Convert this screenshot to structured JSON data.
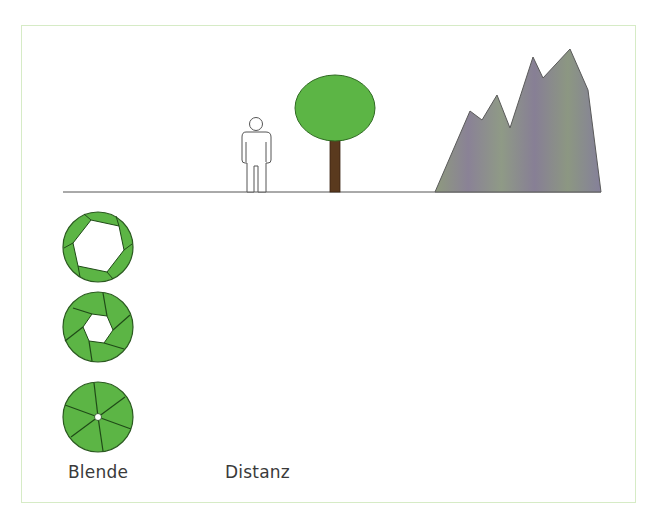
{
  "diagram": {
    "labels": {
      "aperture": "Blende",
      "distance": "Distanz"
    },
    "colors": {
      "frame_border": "#d6ebc6",
      "ground_line": "#555555",
      "tree_crown": "#5cb545",
      "tree_trunk": "#5a3a1e",
      "aperture_fill": "#5cb545",
      "aperture_stroke": "#1f4a17",
      "mountain_fill": "#8a8a90",
      "person_stroke": "#555555"
    },
    "scene": {
      "objects": [
        "person",
        "tree",
        "mountain"
      ],
      "description": "Person near, tree middle, mountains far along a ground line"
    },
    "apertures": [
      {
        "name": "wide-open",
        "opening": "large"
      },
      {
        "name": "medium",
        "opening": "medium"
      },
      {
        "name": "closed-down",
        "opening": "small"
      }
    ]
  }
}
